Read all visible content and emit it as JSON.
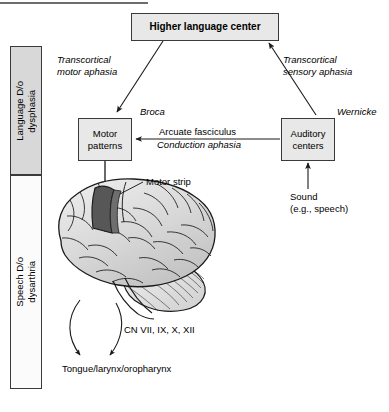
{
  "figure": {
    "title_rule": "top-divider-rule",
    "colors": {
      "box_fill": "#e8e8e8",
      "box_stroke": "#3a3a3a",
      "bar_gray": "#d8d8d8",
      "bar_white": "#fbfbfb",
      "motor_strip": "#575757",
      "brain_fill": "#dcdcdc",
      "line": "#1a1a1a"
    }
  },
  "sidebar": {
    "items": [
      {
        "id": "language-disorder",
        "line1": "Language D/o",
        "line2": "dysphasia",
        "text": "Language D/o\ndysphasia",
        "shade": "gray"
      },
      {
        "id": "speech-disorder",
        "line1": "Speech D/o",
        "line2": "dysarthria",
        "text": "Speech D/o\ndysarthria",
        "shade": "white"
      }
    ]
  },
  "nodes": {
    "higher_language_center": {
      "label": "Higher language center"
    },
    "motor_patterns": {
      "line1": "Motor",
      "line2": "patterns"
    },
    "auditory_centers": {
      "line1": "Auditory",
      "line2": "centers"
    }
  },
  "labels": {
    "broca": "Broca",
    "wernicke": "Wernicke",
    "transcortical_motor": {
      "line1": "Transcortical",
      "line2": "motor aphasia"
    },
    "transcortical_sensory": {
      "line1": "Transcortical",
      "line2": "sensory aphasia"
    },
    "arcuate_fasciculus": "Arcuate fasciculus",
    "conduction_aphasia": "Conduction aphasia",
    "sound": {
      "line1": "Sound",
      "line2": "(e.g., speech)"
    },
    "motor_strip": "Motor strip",
    "cranial_nerves": "CN VII, IX, X, XII",
    "effectors": "Tongue/larynx/oropharynx"
  },
  "connections": [
    {
      "id": "hlc-to-motor-patterns",
      "from": "higher_language_center",
      "to": "motor_patterns",
      "label": "Transcortical motor aphasia",
      "direction": "down-left"
    },
    {
      "id": "auditory-to-hlc",
      "from": "auditory_centers",
      "to": "higher_language_center",
      "label": "Transcortical sensory aphasia",
      "direction": "up-left"
    },
    {
      "id": "auditory-to-motor-patterns",
      "from": "auditory_centers",
      "to": "motor_patterns",
      "label": "Arcuate fasciculus / Conduction aphasia",
      "direction": "left"
    },
    {
      "id": "sound-to-auditory",
      "from": "sound",
      "to": "auditory_centers",
      "direction": "up"
    },
    {
      "id": "motor-patterns-to-motor-strip",
      "from": "motor_patterns",
      "to": "motor_strip",
      "direction": "down"
    },
    {
      "id": "brainstem-to-effectors",
      "from": "cranial_nerves",
      "to": "effectors",
      "direction": "down"
    }
  ]
}
